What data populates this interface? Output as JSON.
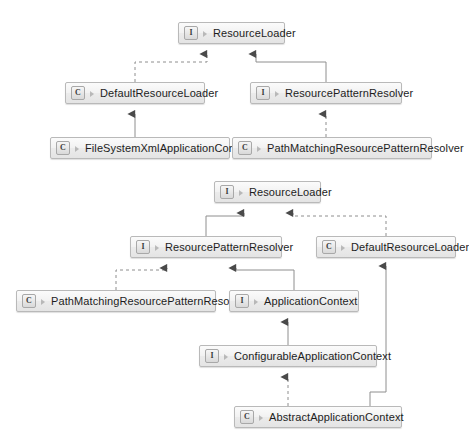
{
  "diagrams": [
    {
      "name": "resource-loader-hierarchy-top",
      "nodes": [
        {
          "id": "d1-resourceloader",
          "stereotype": "I",
          "label": "ResourceLoader",
          "x": 178,
          "y": 22,
          "w": 107
        },
        {
          "id": "d1-defaultresourceloader",
          "stereotype": "C",
          "label": "DefaultResourceLoader",
          "x": 65,
          "y": 82,
          "w": 140
        },
        {
          "id": "d1-resourcepattern",
          "stereotype": "I",
          "label": "ResourcePatternResolver",
          "x": 250,
          "y": 82,
          "w": 152
        },
        {
          "id": "d1-filesystemxml",
          "stereotype": "C",
          "label": "FileSystemXmlApplicationContext",
          "x": 50,
          "y": 137,
          "w": 180
        },
        {
          "id": "d1-pathmatching",
          "stereotype": "C",
          "label": "PathMatchingResourcePatternResolver",
          "x": 232,
          "y": 137,
          "w": 200
        }
      ],
      "edges": [
        {
          "from": "d1-defaultresourceloader",
          "to": "d1-resourceloader",
          "style": "dashed",
          "kind": "realization"
        },
        {
          "from": "d1-resourcepattern",
          "to": "d1-resourceloader",
          "style": "solid",
          "kind": "generalization"
        },
        {
          "from": "d1-filesystemxml",
          "to": "d1-defaultresourceloader",
          "style": "solid",
          "kind": "generalization"
        },
        {
          "from": "d1-pathmatching",
          "to": "d1-resourcepattern",
          "style": "dashed",
          "kind": "realization"
        }
      ]
    },
    {
      "name": "application-context-hierarchy-bottom",
      "nodes": [
        {
          "id": "d2-resourceloader",
          "stereotype": "I",
          "label": "ResourceLoader",
          "x": 214,
          "y": 181,
          "w": 107
        },
        {
          "id": "d2-resourcepattern",
          "stereotype": "I",
          "label": "ResourcePatternResolver",
          "x": 130,
          "y": 236,
          "w": 152
        },
        {
          "id": "d2-defaultresourceloader",
          "stereotype": "C",
          "label": "DefaultResourceLoader",
          "x": 316,
          "y": 236,
          "w": 140
        },
        {
          "id": "d2-pathmatching",
          "stereotype": "C",
          "label": "PathMatchingResourcePatternResolver",
          "x": 16,
          "y": 290,
          "w": 200
        },
        {
          "id": "d2-applicationcontext",
          "stereotype": "I",
          "label": "ApplicationContext",
          "x": 229,
          "y": 290,
          "w": 130
        },
        {
          "id": "d2-configurable",
          "stereotype": "I",
          "label": "ConfigurableApplicationContext",
          "x": 199,
          "y": 345,
          "w": 178
        },
        {
          "id": "d2-abstract",
          "stereotype": "C",
          "label": "AbstractApplicationContext",
          "x": 234,
          "y": 406,
          "w": 168
        }
      ],
      "edges": [
        {
          "from": "d2-resourcepattern",
          "to": "d2-resourceloader",
          "style": "solid",
          "kind": "generalization"
        },
        {
          "from": "d2-defaultresourceloader",
          "to": "d2-resourceloader",
          "style": "dashed",
          "kind": "realization"
        },
        {
          "from": "d2-pathmatching",
          "to": "d2-resourcepattern",
          "style": "dashed",
          "kind": "realization"
        },
        {
          "from": "d2-applicationcontext",
          "to": "d2-resourcepattern",
          "style": "solid",
          "kind": "generalization"
        },
        {
          "from": "d2-configurable",
          "to": "d2-applicationcontext",
          "style": "solid",
          "kind": "generalization"
        },
        {
          "from": "d2-abstract",
          "to": "d2-configurable",
          "style": "dashed",
          "kind": "realization"
        },
        {
          "from": "d2-abstract",
          "to": "d2-defaultresourceloader",
          "style": "solid",
          "kind": "generalization"
        }
      ]
    }
  ],
  "style": {
    "line_color": "#8e8e8e",
    "arrow_color": "#4a4a4a",
    "node_border": "#b9b9b9",
    "text_color": "#1d1d1d"
  }
}
